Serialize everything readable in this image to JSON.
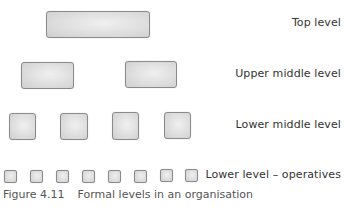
{
  "diagram": {
    "levels": [
      {
        "label": "Top level",
        "count": 1
      },
      {
        "label": "Upper middle level",
        "count": 2
      },
      {
        "label": "Lower middle level",
        "count": 4
      },
      {
        "label": "Lower level – operatives",
        "count": 8
      }
    ]
  },
  "caption": {
    "figure_number": "Figure 4.11",
    "text": "Formal levels in an organisation"
  },
  "colors": {
    "box_fill": "#dcdcdc",
    "box_border": "#8a8a8a",
    "label_text": "#333333",
    "caption_text": "#555555"
  }
}
